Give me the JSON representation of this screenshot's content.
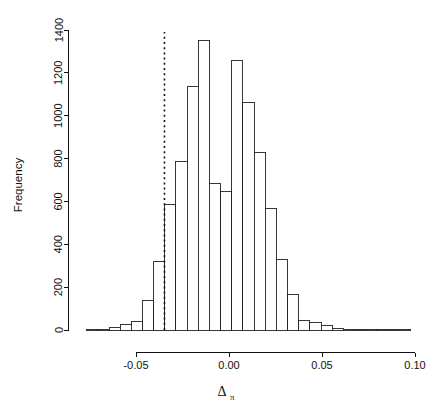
{
  "chart_data": {
    "type": "bar",
    "subtype": "histogram",
    "title": "",
    "xlabel": "Δπ",
    "xlabel_base": "Δ",
    "xlabel_sub": "π",
    "ylabel": "Frequency",
    "xlim": [
      -0.077,
      0.1
    ],
    "ylim": [
      0,
      1430
    ],
    "grid": false,
    "legend": null,
    "bin_width": 0.006,
    "xticks": [
      -0.05,
      0.0,
      0.05,
      0.1
    ],
    "xtick_labels": [
      "-0.05",
      "0.00",
      "0.05",
      "0.10"
    ],
    "yticks": [
      0,
      200,
      400,
      600,
      800,
      1000,
      1200,
      1400
    ],
    "ytick_labels": [
      "0",
      "200",
      "400",
      "600",
      "800",
      "1000",
      "1200",
      "1400"
    ],
    "bin_left_edges": [
      -0.0765,
      -0.0705,
      -0.0645,
      -0.0585,
      -0.0525,
      -0.0465,
      -0.0405,
      -0.0345,
      -0.0285,
      -0.0225,
      -0.0165,
      -0.0105,
      -0.0045,
      0.0015,
      0.0075,
      0.0135,
      0.0195,
      0.0255,
      0.0315,
      0.0375,
      0.0435,
      0.0495,
      0.0555,
      0.0615,
      0.0675,
      0.0735,
      0.0795,
      0.0855,
      0.0915
    ],
    "values": [
      4,
      4,
      12,
      28,
      38,
      138,
      322,
      585,
      785,
      1138,
      1350,
      685,
      645,
      1258,
      1062,
      830,
      565,
      328,
      168,
      45,
      33,
      22,
      5,
      3,
      2,
      1,
      1,
      1,
      1
    ],
    "categories": [
      "-0.0765",
      "-0.0705",
      "-0.0645",
      "-0.0585",
      "-0.0525",
      "-0.0465",
      "-0.0405",
      "-0.0345",
      "-0.0285",
      "-0.0225",
      "-0.0165",
      "-0.0105",
      "-0.0045",
      "0.0015",
      "0.0075",
      "0.0135",
      "0.0195",
      "0.0255",
      "0.0315",
      "0.0375",
      "0.0435",
      "0.0495",
      "0.0555",
      "0.0615",
      "0.0675",
      "0.0735",
      "0.0795",
      "0.0855",
      "0.0915"
    ],
    "annotations": [
      {
        "name": "observed-value-line",
        "kind": "vertical-dotted-line",
        "x": -0.0347,
        "style": "dotted",
        "color": "#111111"
      }
    ],
    "colors": {
      "bar_fill": "#ffffff",
      "bar_stroke": "#222222",
      "axis": "#111111",
      "annotation_line": "#111111",
      "background": "#ffffff"
    }
  }
}
